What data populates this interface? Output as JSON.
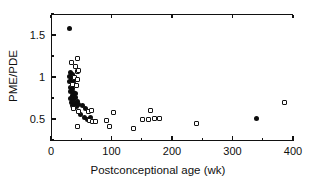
{
  "chart_data": {
    "type": "scatter",
    "title": "",
    "xlabel": "Postconceptional age (wk)",
    "ylabel": "PME/PDE",
    "xlim": [
      0,
      400
    ],
    "ylim": [
      0.25,
      1.75
    ],
    "grid": false,
    "legend": null,
    "xticks": [
      0,
      100,
      200,
      300,
      400
    ],
    "xticklabels": [
      "0",
      "100",
      "200",
      "300",
      "400"
    ],
    "xminorticks": [
      50,
      150,
      250,
      350
    ],
    "yticks": [
      0.5,
      1.0,
      1.5
    ],
    "yticklabels": [
      "0.5",
      "1",
      "1.5"
    ],
    "yminorticks": [
      0.25,
      0.75,
      1.25,
      1.75
    ],
    "series": [
      {
        "name": "filled-circle",
        "marker": "filled circle",
        "color": "#0d0d0d",
        "points": [
          [
            31,
            1.58
          ],
          [
            30,
            1.01
          ],
          [
            33,
            1.05
          ],
          [
            36,
            1.03
          ],
          [
            34,
            0.98
          ],
          [
            31,
            0.95
          ],
          [
            35,
            0.93
          ],
          [
            38,
            0.95
          ],
          [
            33,
            0.88
          ],
          [
            36,
            0.86
          ],
          [
            32,
            0.83
          ],
          [
            38,
            0.82
          ],
          [
            35,
            0.78
          ],
          [
            40,
            0.8
          ],
          [
            33,
            0.75
          ],
          [
            37,
            0.73
          ],
          [
            41,
            0.76
          ],
          [
            34,
            0.7
          ],
          [
            39,
            0.69
          ],
          [
            43,
            0.71
          ],
          [
            36,
            0.66
          ],
          [
            42,
            0.65
          ],
          [
            46,
            0.67
          ],
          [
            52,
            0.66
          ],
          [
            57,
            0.62
          ],
          [
            49,
            0.55
          ],
          [
            55,
            0.52
          ],
          [
            61,
            0.5
          ],
          [
            66,
            0.52
          ],
          [
            339,
            0.51
          ]
        ]
      },
      {
        "name": "open-square",
        "marker": "open square",
        "color": "#141414",
        "points": [
          [
            34,
            1.17
          ],
          [
            44,
            1.22
          ],
          [
            41,
            1.12
          ],
          [
            43,
            1.07
          ],
          [
            46,
            1.08
          ],
          [
            39,
            1.0
          ],
          [
            44,
            0.97
          ],
          [
            36,
            0.91
          ],
          [
            42,
            0.9
          ],
          [
            38,
            0.62
          ],
          [
            45,
            0.59
          ],
          [
            43,
            0.41
          ],
          [
            62,
            0.59
          ],
          [
            67,
            0.6
          ],
          [
            64,
            0.48
          ],
          [
            69,
            0.47
          ],
          [
            74,
            0.47
          ],
          [
            92,
            0.48
          ],
          [
            97,
            0.41
          ],
          [
            103,
            0.58
          ],
          [
            136,
            0.39
          ],
          [
            151,
            0.5
          ],
          [
            161,
            0.5
          ],
          [
            164,
            0.6
          ],
          [
            171,
            0.51
          ],
          [
            179,
            0.51
          ],
          [
            240,
            0.45
          ],
          [
            386,
            0.7
          ]
        ]
      }
    ]
  },
  "axis": {
    "x_title": "Postconceptional age (wk)",
    "y_title": "PME/PDE"
  }
}
